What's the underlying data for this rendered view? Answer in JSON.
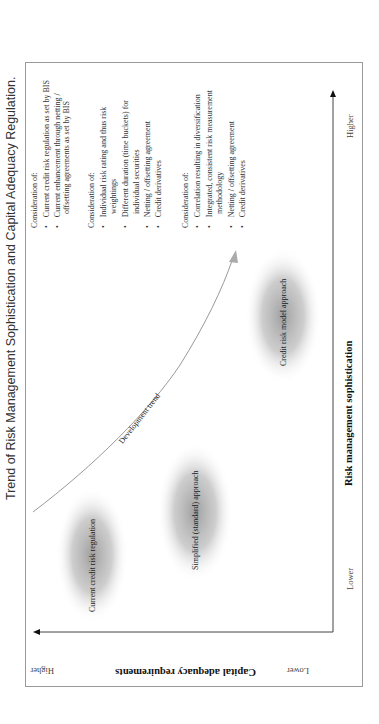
{
  "title": "Trend of Risk Management Sophistication and Capital Adequacy Regulation.",
  "y_axis": {
    "title": "Capital adequacy requirements",
    "high_label": "Higher",
    "low_label": "Lower"
  },
  "x_axis": {
    "title": "Risk management sophistication",
    "high_label": "Higher",
    "low_label": "Lower"
  },
  "trend_label": "Development trend",
  "stages": [
    {
      "label": "Current credit risk regulation"
    },
    {
      "label": "Simplified (standard) approach"
    },
    {
      "label": "Credit risk model approach"
    }
  ],
  "considerations": [
    {
      "heading": "Consideration of:",
      "lines": [
        {
          "bullet": true,
          "text": "Current credit risk regulation as set by BIS"
        },
        {
          "bullet": true,
          "text": "Current enhancement through netting /"
        },
        {
          "bullet": false,
          "text": "offsetting agreements as set by BIS"
        }
      ]
    },
    {
      "heading": "Consideration of:",
      "lines": [
        {
          "bullet": true,
          "text": "Individual risk rating and thus risk"
        },
        {
          "bullet": false,
          "text": "weightings"
        },
        {
          "bullet": true,
          "text": "Different duration (time buckets) for"
        },
        {
          "bullet": false,
          "text": "individual securities"
        },
        {
          "bullet": true,
          "text": "Netting / offsetting agreement"
        },
        {
          "bullet": true,
          "text": "Credit derivatives"
        }
      ]
    },
    {
      "heading": "Consideration of:",
      "lines": [
        {
          "bullet": true,
          "text": "Correlation  resulting in diversification"
        },
        {
          "bullet": true,
          "text": "Integrated, consistent risk measurement"
        },
        {
          "bullet": false,
          "text": "methodology"
        },
        {
          "bullet": true,
          "text": "Netting / offsetting agreement"
        },
        {
          "bullet": true,
          "text": "Credit derivatives"
        }
      ]
    }
  ]
}
